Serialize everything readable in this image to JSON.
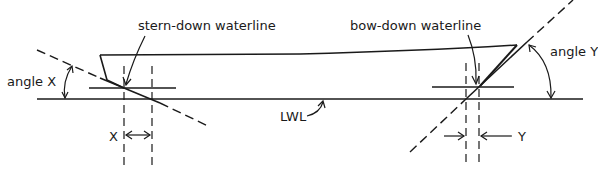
{
  "diagram": {
    "type": "boat trim diagram",
    "labels": {
      "stern_waterline": "stern-down waterline",
      "bow_waterline": "bow-down waterline",
      "angle_x": "angle X",
      "angle_y": "angle Y",
      "x": "X",
      "y": "Y",
      "lwl": "LWL"
    },
    "colors": {
      "ink": "#1a1a1a",
      "background": "#ffffff"
    }
  }
}
